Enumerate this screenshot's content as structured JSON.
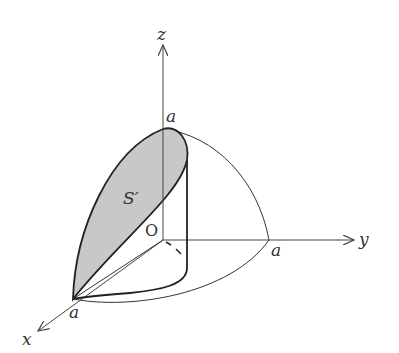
{
  "figure": {
    "type": "3d-region-diagram"
  },
  "labels": {
    "z_axis": "z",
    "y_axis": "y",
    "x_axis": "x",
    "origin": "O",
    "a_on_z": "a",
    "a_on_y": "a",
    "a_on_x": "a",
    "surface": "S′"
  },
  "colors": {
    "line": "#2a2a2a",
    "axis": "#444444",
    "shade": "#c8c8c8",
    "background": "#ffffff"
  }
}
